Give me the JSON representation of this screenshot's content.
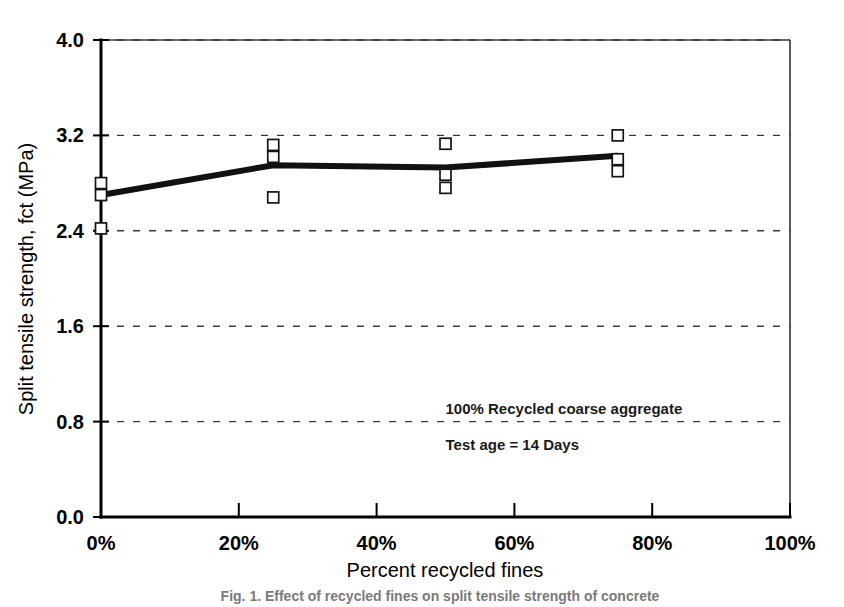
{
  "figure": {
    "caption": "Fig. 1. Effect of recycled fines on split tensile strength of concrete"
  },
  "chart_data": {
    "type": "scatter",
    "title": "",
    "xlabel": "Percent recycled fines",
    "ylabel": "Split tensile strength, fct (MPa)",
    "xlim": [
      0,
      100
    ],
    "ylim": [
      0,
      4.0
    ],
    "xticks": [
      0,
      20,
      40,
      60,
      80,
      100
    ],
    "xtick_labels": [
      "0%",
      "20%",
      "40%",
      "60%",
      "80%",
      "100%"
    ],
    "yticks": [
      0.0,
      0.8,
      1.6,
      2.4,
      3.2,
      4.0
    ],
    "ytick_labels": [
      "0.0",
      "0.8",
      "1.6",
      "2.4",
      "3.2",
      "4.0"
    ],
    "grid": "horizontal-dashed",
    "legend": "none",
    "annotations": [
      {
        "text": "100% Recycled coarse aggregate",
        "x": 50,
        "y": 0.86
      },
      {
        "text": "Test age = 14 Days",
        "x": 50,
        "y": 0.56
      }
    ],
    "series": [
      {
        "name": "Individual specimens",
        "marker": "open-square",
        "points": [
          {
            "x": 0,
            "y": 2.8
          },
          {
            "x": 0,
            "y": 2.7
          },
          {
            "x": 0,
            "y": 2.42
          },
          {
            "x": 25,
            "y": 3.12
          },
          {
            "x": 25,
            "y": 3.02
          },
          {
            "x": 25,
            "y": 2.68
          },
          {
            "x": 50,
            "y": 3.13
          },
          {
            "x": 50,
            "y": 2.87
          },
          {
            "x": 50,
            "y": 2.76
          },
          {
            "x": 75,
            "y": 3.2
          },
          {
            "x": 75,
            "y": 3.0
          },
          {
            "x": 75,
            "y": 2.9
          }
        ]
      },
      {
        "name": "Mean trend",
        "marker": "none",
        "points": [
          {
            "x": 0,
            "y": 2.7
          },
          {
            "x": 25,
            "y": 2.95
          },
          {
            "x": 50,
            "y": 2.93
          },
          {
            "x": 75,
            "y": 3.03
          }
        ]
      }
    ]
  }
}
